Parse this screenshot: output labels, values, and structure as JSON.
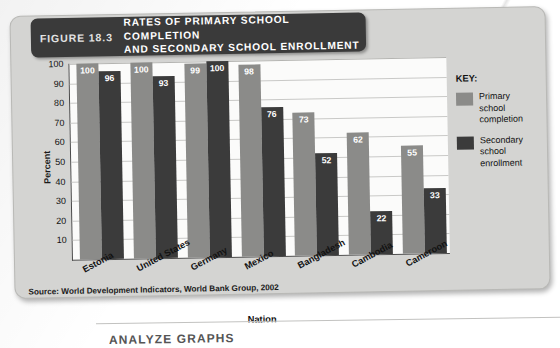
{
  "figure": {
    "number": "FIGURE 18.3",
    "title_line1": "RATES OF PRIMARY SCHOOL COMPLETION",
    "title_line2": "AND SECONDARY SCHOOL ENROLLMENT",
    "source": "Source: World Development Indicators, World Bank Group, 2002"
  },
  "legend": {
    "title": "KEY:",
    "items": [
      {
        "label": "Primary school completion",
        "color": "#8b8b89"
      },
      {
        "label": "Secondary school enrollment",
        "color": "#3b3b3b"
      }
    ]
  },
  "page": {
    "bottom_caption": "ANALYZE GRAPHS"
  },
  "chart_data": {
    "type": "bar",
    "title": "RATES OF PRIMARY SCHOOL COMPLETION AND SECONDARY SCHOOL ENROLLMENT",
    "xlabel": "Nation",
    "ylabel": "Percent",
    "ylim": [
      0,
      100
    ],
    "yticks": [
      100,
      90,
      80,
      70,
      60,
      50,
      40,
      30,
      20,
      10
    ],
    "grid": true,
    "legend_position": "right",
    "categories": [
      "Estonia",
      "United States",
      "Germany",
      "Mexico",
      "Bangladesh",
      "Cambodia",
      "Cameroon"
    ],
    "series": [
      {
        "name": "Primary school completion",
        "color": "#8b8b89",
        "values": [
          100,
          100,
          99,
          98,
          73,
          62,
          55
        ]
      },
      {
        "name": "Secondary school enrollment",
        "color": "#3b3b3b",
        "values": [
          96,
          93,
          100,
          76,
          52,
          22,
          33
        ]
      }
    ]
  }
}
